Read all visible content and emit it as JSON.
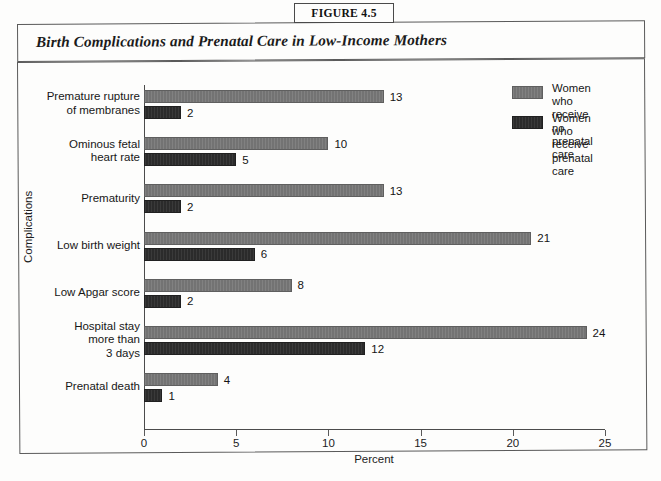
{
  "figure": {
    "tab_label": "FIGURE 4.5",
    "title": "Birth Complications and Prenatal Care in Low-Income Mothers"
  },
  "legend": {
    "position": "top-right",
    "entries": [
      {
        "label": "Women who receive\nno prenatal care",
        "color": "#737373",
        "series": "no_prenatal_care"
      },
      {
        "label": "Women who receive\nprenatal care",
        "color": "#2b2b2b",
        "series": "prenatal_care"
      }
    ]
  },
  "chart_data": {
    "type": "bar",
    "orientation": "horizontal",
    "title": "Birth Complications and Prenatal Care in Low-Income Mothers",
    "xlabel": "Percent",
    "ylabel": "Complications",
    "xlim": [
      0,
      25
    ],
    "xticks": [
      0,
      5,
      10,
      15,
      20,
      25
    ],
    "xtick_labels": [
      "0",
      "5",
      "10",
      "15",
      "20",
      "25"
    ],
    "grid": false,
    "data_labels": true,
    "categories": [
      "Premature rupture\nof membranes",
      "Ominous fetal\nheart rate",
      "Prematurity",
      "Low birth weight",
      "Low Apgar score",
      "Hospital stay\nmore than\n3 days",
      "Prenatal death"
    ],
    "series": [
      {
        "name": "Women who receive no prenatal care",
        "key": "no_prenatal_care",
        "color": "#737373",
        "values": [
          13,
          10,
          13,
          21,
          8,
          24,
          4
        ]
      },
      {
        "name": "Women who receive prenatal care",
        "key": "prenatal_care",
        "color": "#2b2b2b",
        "values": [
          2,
          5,
          2,
          6,
          2,
          12,
          1
        ]
      }
    ]
  }
}
